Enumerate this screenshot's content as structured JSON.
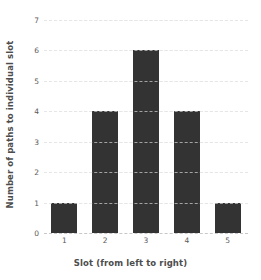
{
  "chart_data": {
    "type": "bar",
    "title": "",
    "xlabel": "Slot (from left to right)",
    "ylabel": "Number of paths to individual slot",
    "categories": [
      "1",
      "2",
      "3",
      "4",
      "5"
    ],
    "values": [
      1,
      4,
      6,
      4,
      1
    ],
    "ylim": [
      0,
      7
    ],
    "yticks": [
      0,
      1,
      2,
      3,
      4,
      5,
      6,
      7
    ],
    "ytick_labels": [
      "0",
      "1",
      "2",
      "3",
      "4",
      "5",
      "6",
      "7"
    ],
    "xlim_categories": 5,
    "grid": "horizontal-dashed",
    "legend": "none",
    "colors": {
      "bar": "#333333",
      "background": "#ffffff",
      "gridline": "#c8c8c8",
      "gridline_over_bar": "#ffffff",
      "text": "#4d4d4d",
      "tick_text": "#5a5a5a"
    }
  }
}
